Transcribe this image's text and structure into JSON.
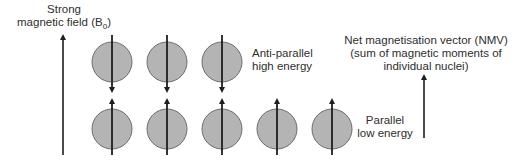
{
  "field_label": {
    "line1": "Strong",
    "line2_prefix": "magnetic field (B",
    "line2_sub": "0",
    "line2_suffix": ")"
  },
  "antiparallel_label": {
    "line1": "Anti-parallel",
    "line2": "high energy"
  },
  "parallel_label": {
    "line1": "Parallel",
    "line2": "low energy"
  },
  "nmv_label": {
    "line1": "Net magnetisation vector (NMV)",
    "line2": "(sum of magnetic moments of",
    "line3": "individual nuclei)"
  },
  "colors": {
    "nucleus_fill": "#b4b4b4",
    "nucleus_stroke": "#6e6e6e",
    "arrow": "#1e1e1e",
    "text": "#2e2e2e"
  },
  "nuclei": {
    "antiparallel_count": 3,
    "parallel_count": 5
  }
}
